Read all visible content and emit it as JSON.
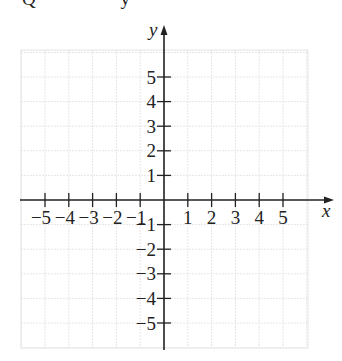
{
  "header": {
    "cut_text_left": "Q",
    "cut_text_right": "y"
  },
  "chart_data": {
    "type": "scatter",
    "title": "",
    "xlabel": "x",
    "ylabel": "y",
    "xlim": [
      -6,
      6
    ],
    "ylim": [
      -6,
      6
    ],
    "grid": true,
    "x_ticks": [
      -5,
      -4,
      -3,
      -2,
      -1,
      1,
      2,
      3,
      4,
      5
    ],
    "y_ticks": [
      -5,
      -4,
      -3,
      -2,
      -1,
      1,
      2,
      3,
      4,
      5
    ],
    "x_tick_labels": [
      "−5",
      "−4",
      "−3",
      "−2",
      "−1",
      "1",
      "2",
      "3",
      "4",
      "5"
    ],
    "y_tick_labels": [
      "5",
      "4",
      "3",
      "2",
      "1",
      "−1",
      "−2",
      "−3",
      "−4",
      "−5"
    ],
    "points": []
  },
  "axes": {
    "x_label": "x",
    "y_label": "y"
  },
  "colors": {
    "grid": "#e6e6e6",
    "axis": "#222222"
  }
}
